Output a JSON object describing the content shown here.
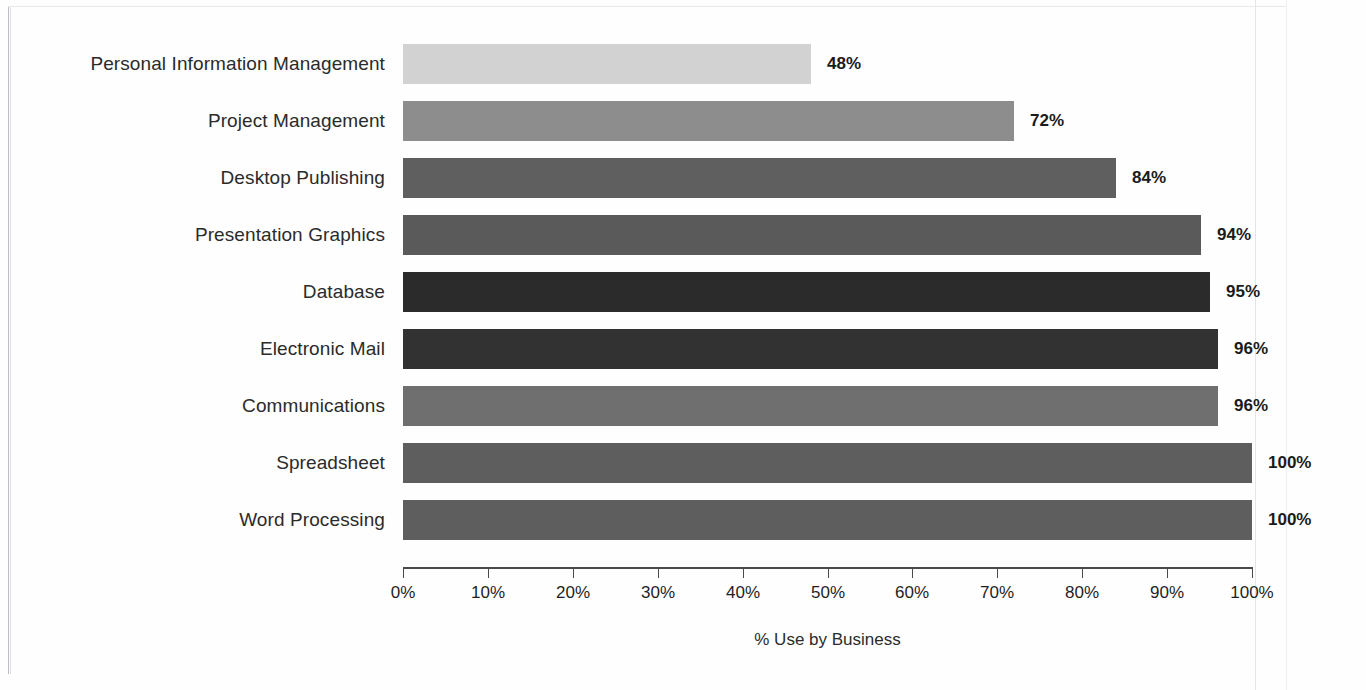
{
  "chart_data": {
    "type": "bar",
    "orientation": "horizontal",
    "title": "",
    "xlabel": "% Use by Business",
    "ylabel": "",
    "xlim": [
      0,
      100
    ],
    "grid": false,
    "legend": false,
    "categories": [
      "Personal Information Management",
      "Project Management",
      "Desktop Publishing",
      "Presentation Graphics",
      "Database",
      "Electronic Mail",
      "Communications",
      "Spreadsheet",
      "Word Processing"
    ],
    "values": [
      48,
      72,
      84,
      94,
      95,
      96,
      96,
      100,
      100
    ],
    "value_labels": [
      "48%",
      "72%",
      "84%",
      "94%",
      "95%",
      "96%",
      "96%",
      "100%",
      "100%"
    ],
    "bar_colors": [
      "#d2d2d2",
      "#8d8d8d",
      "#5f5f5f",
      "#5a5a5a",
      "#2b2b2b",
      "#323232",
      "#6f6f6f",
      "#5e5e5e",
      "#5e5e5e"
    ],
    "xticks": [
      0,
      10,
      20,
      30,
      40,
      50,
      60,
      70,
      80,
      90,
      100
    ],
    "xtick_labels": [
      "0%",
      "10%",
      "20%",
      "30%",
      "40%",
      "50%",
      "60%",
      "70%",
      "80%",
      "90%",
      "100%"
    ]
  },
  "axis": {
    "title": "% Use by Business",
    "line_color": "#4a4a4a"
  },
  "page": {
    "background": "#fefefe",
    "frame_color": "#b9bcc0"
  }
}
